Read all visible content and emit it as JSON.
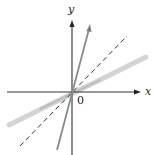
{
  "diagram": {
    "type": "graph-of-function-and-inverse",
    "axes": {
      "x_label": "x",
      "y_label": "y",
      "origin_label": "0"
    },
    "lines": [
      {
        "name": "steep-line",
        "style": "solid",
        "color": "#8a8a8a",
        "description": "steep line through origin"
      },
      {
        "name": "identity-line",
        "style": "dashed",
        "color": "#333333",
        "description": "y = x"
      },
      {
        "name": "shallow-line",
        "style": "solid-thick",
        "color": "#d0d0d0",
        "description": "reflection of steep line across y = x"
      }
    ]
  }
}
